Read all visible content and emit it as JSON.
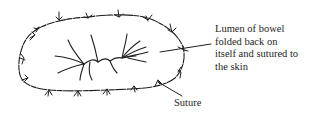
{
  "diagram": {
    "labels": {
      "lumen": "Lumen of bowel\nfolded back on\nitself and sutured to\nthe skin",
      "suture": "Suture"
    },
    "colors": {
      "ink": "#1e1e1e",
      "background": "#ffffff"
    },
    "parts": [
      "skin-edge-outline",
      "suture-marks",
      "mucosal-fold-lines",
      "lumen-leader-line",
      "suture-leader-line"
    ]
  }
}
